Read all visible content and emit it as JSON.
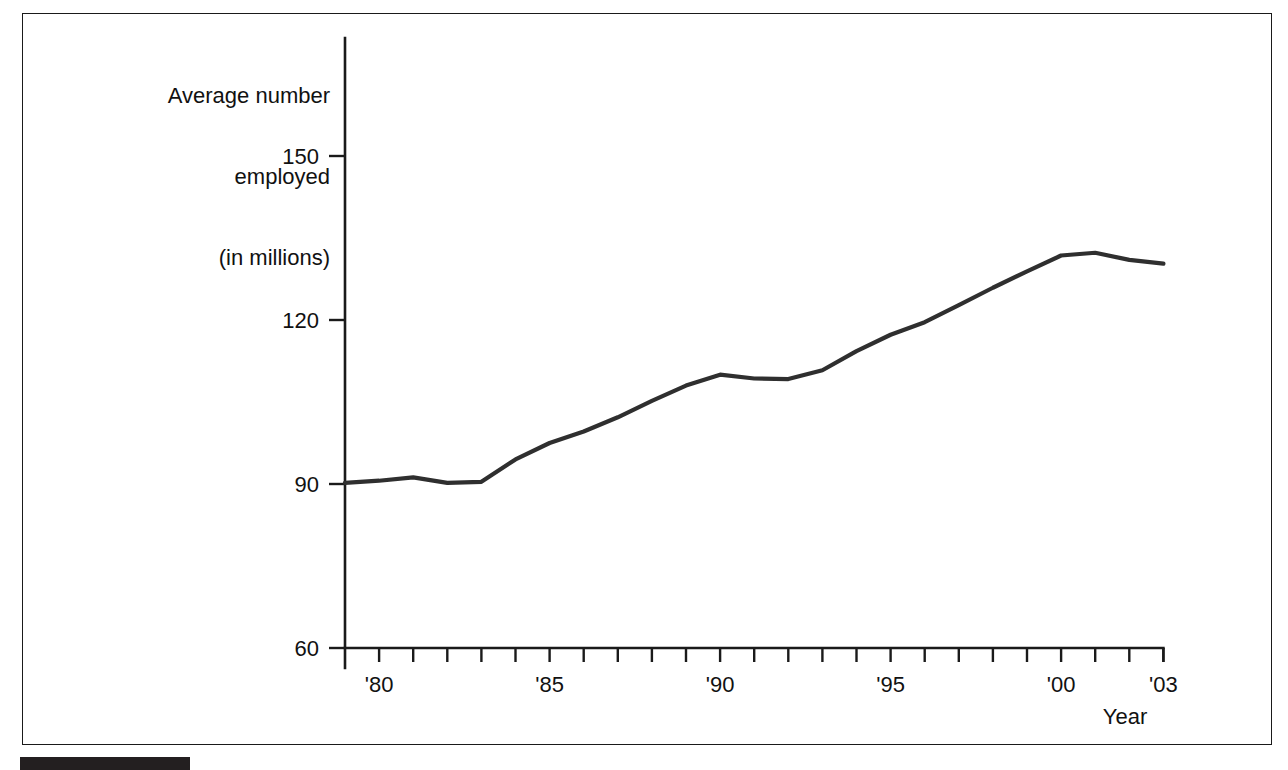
{
  "figure": {
    "y_axis_title_lines": [
      "Average number",
      "employed",
      "(in millions)"
    ],
    "x_axis_title": "Year",
    "line_color": "#2f2f2f",
    "axis_color": "#1a1a1a",
    "background_color": "#ffffff",
    "footer_bar_color": "#231f20"
  },
  "chart_data": {
    "type": "line",
    "title": "",
    "subtitle": "",
    "xlabel": "Year",
    "ylabel": "Average number employed (in millions)",
    "xlim": [
      1979,
      2003
    ],
    "ylim": [
      60,
      150
    ],
    "grid": false,
    "legend": "none",
    "y_ticks": [
      60,
      90,
      120,
      150
    ],
    "y_tick_labels": [
      "60",
      "90",
      "120",
      "150"
    ],
    "x_ticks": [
      1980,
      1985,
      1990,
      1995,
      2000,
      2003
    ],
    "x_tick_labels": [
      "'80",
      "'85",
      "'90",
      "'95",
      "'00",
      "'03"
    ],
    "x_minor_tick_years": [
      1979,
      1980,
      1981,
      1982,
      1983,
      1984,
      1985,
      1986,
      1987,
      1988,
      1989,
      1990,
      1991,
      1992,
      1993,
      1994,
      1995,
      1996,
      1997,
      1998,
      1999,
      2000,
      2001,
      2002,
      2003
    ],
    "x": [
      1979,
      1980,
      1981,
      1982,
      1983,
      1984,
      1985,
      1986,
      1987,
      1988,
      1989,
      1990,
      1991,
      1992,
      1993,
      1994,
      1995,
      1996,
      1997,
      1998,
      1999,
      2000,
      2001,
      2002,
      2003
    ],
    "values": [
      90.2,
      90.6,
      91.2,
      90.2,
      90.4,
      94.5,
      97.5,
      99.6,
      102.2,
      105.2,
      108.0,
      110.0,
      109.3,
      109.2,
      110.8,
      114.3,
      117.3,
      119.6,
      122.7,
      125.9,
      128.9,
      131.8,
      132.3,
      131.0,
      130.3
    ],
    "series": [
      {
        "name": "Average number employed (in millions)",
        "values": [
          90.2,
          90.6,
          91.2,
          90.2,
          90.4,
          94.5,
          97.5,
          99.6,
          102.2,
          105.2,
          108.0,
          110.0,
          109.3,
          109.2,
          110.8,
          114.3,
          117.3,
          119.6,
          122.7,
          125.9,
          128.9,
          131.8,
          132.3,
          131.0,
          130.3
        ]
      }
    ],
    "annotations": []
  }
}
